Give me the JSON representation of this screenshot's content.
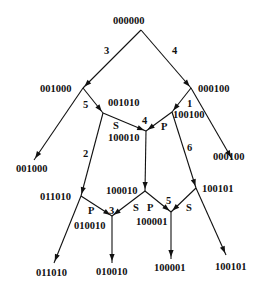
{
  "diagram": {
    "nodes": [
      {
        "id": "n_root",
        "label": "000000",
        "x": 141,
        "y": 30,
        "lx": 113,
        "ly": 24
      },
      {
        "id": "n_001000",
        "label": "001000",
        "x": 83,
        "y": 88,
        "lx": 40,
        "ly": 92
      },
      {
        "id": "n_000100",
        "label": "000100",
        "x": 191,
        "y": 88,
        "lx": 198,
        "ly": 92
      },
      {
        "id": "n_001010",
        "label": "001010",
        "x": 103,
        "y": 113,
        "lx": 108,
        "ly": 106
      },
      {
        "id": "n_100100",
        "label": "100100",
        "x": 172,
        "y": 112,
        "lx": 173,
        "ly": 118
      },
      {
        "id": "n_100010a",
        "label": "100010",
        "x": 146,
        "y": 131,
        "lx": 108,
        "ly": 141
      },
      {
        "id": "n_leaf_001000",
        "label": "001000",
        "x": 34,
        "y": 160,
        "lx": 16,
        "ly": 172
      },
      {
        "id": "n_leaf_000100",
        "label": "000100",
        "x": 232,
        "y": 159,
        "lx": 213,
        "ly": 160
      },
      {
        "id": "n_011010",
        "label": "011010",
        "x": 81,
        "y": 196,
        "lx": 40,
        "ly": 200
      },
      {
        "id": "n_100010b",
        "label": "100010",
        "x": 145,
        "y": 191,
        "lx": 106,
        "ly": 194
      },
      {
        "id": "n_100101",
        "label": "100101",
        "x": 196,
        "y": 188,
        "lx": 202,
        "ly": 192
      },
      {
        "id": "n_010010",
        "label": "010010",
        "x": 112,
        "y": 216,
        "lx": 74,
        "ly": 229
      },
      {
        "id": "n_100001",
        "label": "100001",
        "x": 171,
        "y": 212,
        "lx": 136,
        "ly": 225
      },
      {
        "id": "n_leaf_011010",
        "label": "011010",
        "x": 54,
        "y": 263,
        "lx": 36,
        "ly": 276
      },
      {
        "id": "n_leaf_010010",
        "label": "010010",
        "x": 112,
        "y": 263,
        "lx": 96,
        "ly": 275
      },
      {
        "id": "n_leaf_100001",
        "label": "100001",
        "x": 171,
        "y": 259,
        "lx": 154,
        "ly": 271
      },
      {
        "id": "n_leaf_100101",
        "label": "100101",
        "x": 226,
        "y": 255,
        "lx": 215,
        "ly": 270
      }
    ],
    "edges": [
      {
        "from": [
          141,
          30
        ],
        "to": [
          83,
          88
        ],
        "label": "3",
        "lx": 104,
        "ly": 54
      },
      {
        "from": [
          141,
          30
        ],
        "to": [
          191,
          88
        ],
        "label": "4",
        "lx": 172,
        "ly": 54
      },
      {
        "from": [
          83,
          88
        ],
        "to": [
          34,
          160
        ],
        "label": "",
        "lx": 0,
        "ly": 0
      },
      {
        "from": [
          191,
          88
        ],
        "to": [
          232,
          159
        ],
        "label": "",
        "lx": 0,
        "ly": 0
      },
      {
        "from": [
          83,
          88
        ],
        "to": [
          103,
          113
        ],
        "label": "5",
        "lx": 83,
        "ly": 108
      },
      {
        "from": [
          191,
          88
        ],
        "to": [
          172,
          112
        ],
        "label": "1",
        "lx": 187,
        "ly": 107
      },
      {
        "from": [
          103,
          113
        ],
        "to": [
          146,
          131
        ],
        "label": "S",
        "lx": 113,
        "ly": 129
      },
      {
        "from": [
          172,
          112
        ],
        "to": [
          146,
          131
        ],
        "label": "P",
        "lx": 161,
        "ly": 130
      },
      {
        "from": [
          103,
          113
        ],
        "to": [
          81,
          196
        ],
        "label": "2",
        "lx": 83,
        "ly": 157
      },
      {
        "from": [
          172,
          112
        ],
        "to": [
          196,
          188
        ],
        "label": "6",
        "lx": 187,
        "ly": 151
      },
      {
        "from": [
          146,
          131
        ],
        "to": [
          145,
          191
        ],
        "label": "",
        "lx": 0,
        "ly": 0
      },
      {
        "from": [
          81,
          196
        ],
        "to": [
          112,
          216
        ],
        "label": "P",
        "lx": 88,
        "ly": 214
      },
      {
        "from": [
          145,
          191
        ],
        "to": [
          112,
          216
        ],
        "label": "S",
        "lx": 133,
        "ly": 211
      },
      {
        "from": [
          145,
          191
        ],
        "to": [
          171,
          212
        ],
        "label": "P",
        "lx": 147,
        "ly": 211
      },
      {
        "from": [
          196,
          188
        ],
        "to": [
          171,
          212
        ],
        "label": "S",
        "lx": 186,
        "ly": 211
      },
      {
        "from": [
          81,
          196
        ],
        "to": [
          54,
          263
        ],
        "label": "",
        "lx": 0,
        "ly": 0
      },
      {
        "from": [
          112,
          216
        ],
        "to": [
          112,
          263
        ],
        "label": "",
        "lx": 0,
        "ly": 0
      },
      {
        "from": [
          171,
          212
        ],
        "to": [
          171,
          259
        ],
        "label": "",
        "lx": 0,
        "ly": 0
      },
      {
        "from": [
          196,
          188
        ],
        "to": [
          226,
          255
        ],
        "label": "",
        "lx": 0,
        "ly": 0
      }
    ],
    "extra_labels": [
      {
        "text": "4",
        "x": 142,
        "y": 124
      },
      {
        "text": "3",
        "x": 109,
        "y": 214
      },
      {
        "text": "5",
        "x": 166,
        "y": 204
      }
    ]
  }
}
